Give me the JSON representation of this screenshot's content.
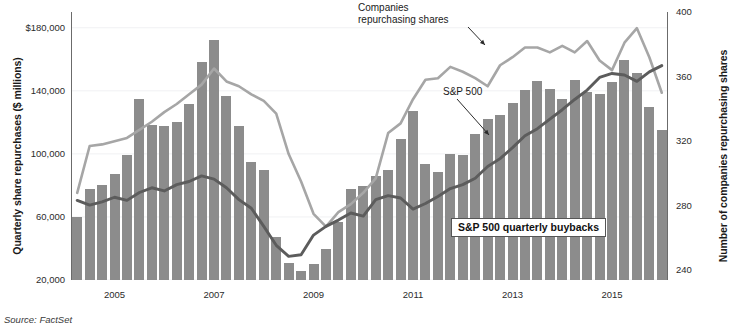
{
  "source_note": "Source: FactSet",
  "chart_data": {
    "type": "bar",
    "title": "",
    "xlabel": "",
    "ylabel": "Quarterly share repurchases ($ millions)",
    "y2label": "Number of companies repurchasing shares",
    "grid": true,
    "legend_position": "inline-annotations",
    "ylim": [
      20000,
      190000
    ],
    "y2lim": [
      234,
      400
    ],
    "yticks": [
      20000,
      60000,
      100000,
      140000,
      180000
    ],
    "yticklabels": [
      "20,000",
      "60,000",
      "100,000",
      "140,000",
      "$180,000"
    ],
    "y2ticks": [
      240,
      280,
      320,
      360,
      400
    ],
    "y2ticklabels": [
      "240",
      "280",
      "320",
      "360",
      "400"
    ],
    "xticks": [
      "2005",
      "2007",
      "2009",
      "2011",
      "2013",
      "2015"
    ],
    "xtick_index": [
      3,
      11,
      19,
      27,
      35,
      43
    ],
    "categories": [
      "2004Q4",
      "2005Q1",
      "2005Q2",
      "2005Q3",
      "2005Q4",
      "2006Q1",
      "2006Q2",
      "2006Q3",
      "2006Q4",
      "2007Q1",
      "2007Q2",
      "2007Q3",
      "2007Q4",
      "2008Q1",
      "2008Q2",
      "2008Q3",
      "2008Q4",
      "2009Q1",
      "2009Q2",
      "2009Q3",
      "2009Q4",
      "2010Q1",
      "2010Q2",
      "2010Q3",
      "2010Q4",
      "2011Q1",
      "2011Q2",
      "2011Q3",
      "2011Q4",
      "2012Q1",
      "2012Q2",
      "2012Q3",
      "2012Q4",
      "2013Q1",
      "2013Q2",
      "2013Q3",
      "2013Q4",
      "2014Q1",
      "2014Q2",
      "2014Q3",
      "2014Q4",
      "2015Q1",
      "2015Q2",
      "2015Q3",
      "2015Q4",
      "2016Q1",
      "2016Q2",
      "2016Q3"
    ],
    "series": [
      {
        "name": "S&P 500 quarterly buybacks",
        "kind": "bar",
        "axis": "left",
        "unit": "$ millions",
        "color": "#8c8c8c",
        "values": [
          60000,
          78000,
          80500,
          87000,
          99500,
          135000,
          118500,
          118000,
          120500,
          131500,
          158000,
          172000,
          137000,
          117500,
          95000,
          90000,
          47000,
          31000,
          26000,
          30000,
          39500,
          56500,
          77500,
          79500,
          86000,
          89500,
          109500,
          127000,
          93500,
          88500,
          100000,
          99500,
          112500,
          122000,
          124500,
          132500,
          140500,
          146500,
          141000,
          135000,
          147000,
          139500,
          138000,
          145500,
          159500,
          151000,
          130000,
          115000
        ]
      },
      {
        "name": "Companies repurchasing shares",
        "kind": "line",
        "axis": "right",
        "unit": "companies",
        "color": "#a6a6a6",
        "values": [
          288,
          317,
          318,
          320,
          322,
          327,
          332,
          338,
          343,
          349,
          355,
          365,
          357,
          354,
          349,
          345,
          337,
          312,
          295,
          275,
          267,
          276,
          281,
          288,
          297,
          325,
          331,
          346,
          358,
          359,
          366,
          363,
          359,
          354,
          367,
          372,
          378,
          378,
          375,
          379,
          375,
          382,
          370,
          364,
          381,
          390,
          372,
          350
        ]
      },
      {
        "name": "S&P 500",
        "kind": "line",
        "axis": "left-proxy",
        "unit": "index (rescaled)",
        "color": "#5c5c5c",
        "values": [
          70500,
          67500,
          69500,
          72500,
          70500,
          75500,
          78500,
          76500,
          80500,
          82500,
          86000,
          84000,
          78500,
          71000,
          65500,
          54000,
          42000,
          35000,
          36000,
          48500,
          54000,
          58000,
          62500,
          60500,
          71000,
          73500,
          72000,
          65000,
          68500,
          73000,
          78000,
          80500,
          84500,
          92000,
          97000,
          104000,
          111500,
          116000,
          122000,
          128000,
          134500,
          140500,
          148500,
          151000,
          150000,
          146000,
          152000,
          156000
        ]
      }
    ],
    "annotations": [
      {
        "name": "companies-repurchasing-shares-label",
        "text": "Companies\nrepurchasing shares",
        "x_px": 358,
        "y_px": 2,
        "arrow_to_x": 485,
        "arrow_to_y": 45
      },
      {
        "name": "sp500-label",
        "text": "S&P 500",
        "x_px": 443,
        "y_px": 86,
        "arrow_to_x": 489,
        "arrow_to_y": 135
      },
      {
        "name": "buybacks-box-label",
        "text": "S&P 500 quarterly buybacks",
        "x_px": 451,
        "y_px": 218
      }
    ]
  }
}
